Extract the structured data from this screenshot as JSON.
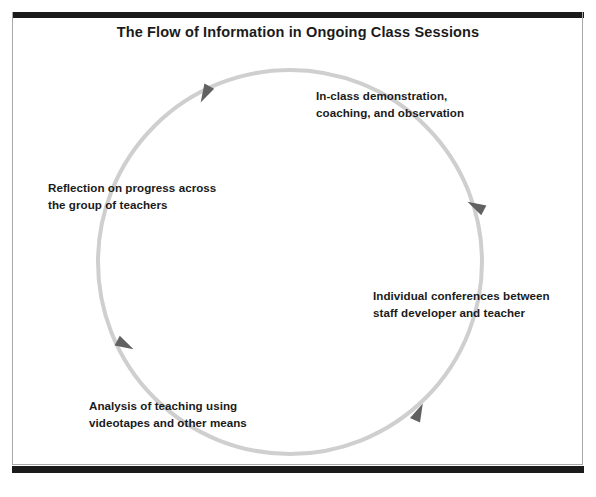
{
  "figure": {
    "title": "The Flow of Information in Ongoing Class Sessions",
    "diagram_type": "cycle",
    "flow_direction": "counterclockwise",
    "colors": {
      "rule": "#1a1a1a",
      "frame": "#a8a8a8",
      "ring": "#cfcfcf",
      "arrowhead": "#616161",
      "text": "#1b1b1b",
      "background": "#ffffff"
    },
    "ring": {
      "center_x": 290,
      "center_y": 262,
      "radius": 192,
      "stroke_width": 4
    },
    "nodes": [
      {
        "id": "in-class-demonstration",
        "label": "In-class demonstration,\ncoaching, and observation",
        "position": "top-right"
      },
      {
        "id": "individual-conferences",
        "label": "Individual conferences between\nstaff developer and teacher",
        "position": "right"
      },
      {
        "id": "analysis-of-teaching",
        "label": "Analysis of teaching using\nvideotapes and other means",
        "position": "bottom-left"
      },
      {
        "id": "reflection-on-progress",
        "label": "Reflection on progress across\nthe group of teachers",
        "position": "left"
      }
    ],
    "arrowheads": [
      {
        "id": "arrow-top",
        "angle_deg": 118,
        "points_to": "in-class-demonstration"
      },
      {
        "id": "arrow-right",
        "angle_deg": 22,
        "points_to": "individual-conferences"
      },
      {
        "id": "arrow-bottom-right",
        "angle_deg": -52,
        "points_to": "analysis-of-teaching"
      },
      {
        "id": "arrow-bottom-left",
        "angle_deg": 205,
        "points_to": "reflection-on-progress"
      }
    ]
  }
}
